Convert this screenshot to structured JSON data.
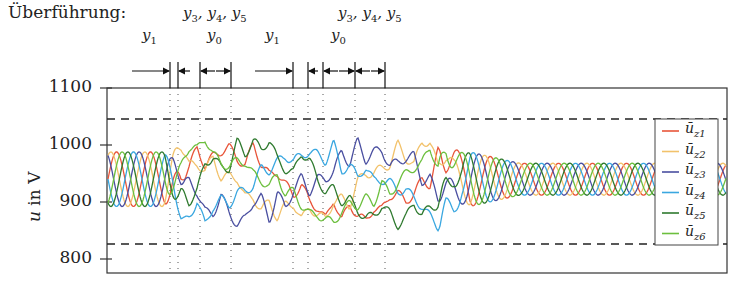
{
  "chart_data": {
    "type": "line",
    "title": "Überführung:",
    "xlabel": "",
    "ylabel": "u in V",
    "ylim": [
      790,
      1100
    ],
    "yticks": [
      800,
      900,
      1000,
      1100
    ],
    "grid": false,
    "legend_position": "right-inside",
    "reference_lines": [
      {
        "style": "dashed",
        "value": 1045
      },
      {
        "style": "dashed",
        "value": 825
      }
    ],
    "series": [
      {
        "name": "ū_z1",
        "color": "#e8553a"
      },
      {
        "name": "ū_z2",
        "color": "#f2c26b"
      },
      {
        "name": "ū_z3",
        "color": "#4a4fa0"
      },
      {
        "name": "ū_z4",
        "color": "#3aa7e0"
      },
      {
        "name": "ū_z5",
        "color": "#2f7a2f"
      },
      {
        "name": "ū_z6",
        "color": "#6cbf3e"
      }
    ],
    "steady_state": {
      "min": 890,
      "max": 990,
      "mean": 940
    },
    "phase_annotations": [
      {
        "label": "y1",
        "segment": "first"
      },
      {
        "label": "y3,y4,y5",
        "segment": "first"
      },
      {
        "label": "y0",
        "segment": "first"
      },
      {
        "label": "y1",
        "segment": "second"
      },
      {
        "label": "y0",
        "segment": "second"
      },
      {
        "label": "y3,y4,y5",
        "segment": "second"
      }
    ]
  },
  "header": {
    "title": "Überführung:",
    "ann_y345_a": "y",
    "ann_y1_a": "y",
    "ann_y0_a": "y"
  },
  "axis": {
    "ylabel_u": "u",
    "ylabel_rest": " in V",
    "ticks": [
      "1100",
      "1000",
      "900",
      "800"
    ]
  },
  "legend": {
    "items": [
      {
        "base": "ū",
        "sub": "z1",
        "color": "#e8553a"
      },
      {
        "base": "ū",
        "sub": "z2",
        "color": "#f2c26b"
      },
      {
        "base": "ū",
        "sub": "z3",
        "color": "#4a4fa0"
      },
      {
        "base": "ū",
        "sub": "z4",
        "color": "#3aa7e0"
      },
      {
        "base": "ū",
        "sub": "z5",
        "color": "#2f7a2f"
      },
      {
        "base": "ū",
        "sub": "z6",
        "color": "#6cbf3e"
      }
    ]
  }
}
